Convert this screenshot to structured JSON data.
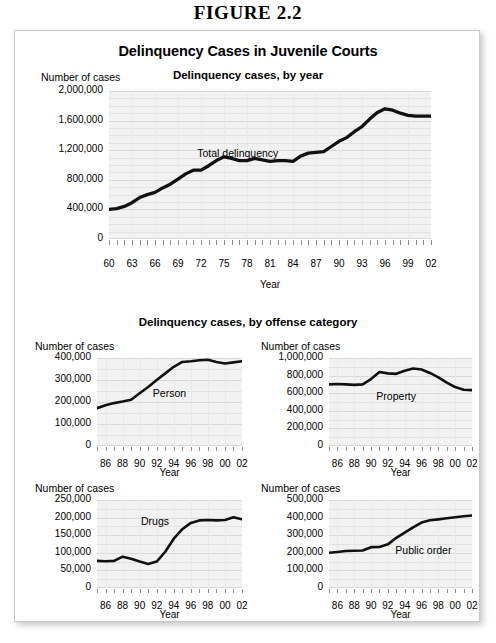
{
  "figure": {
    "caption": "FIGURE 2.2",
    "card_title": "Delinquency Cases in Juvenile Courts"
  },
  "sections": {
    "top_title": "Delinquency cases, by year",
    "bottom_title": "Delinquency cases, by offense category"
  },
  "common": {
    "y_axis_title": "Number of cases",
    "x_axis_title": "Year"
  },
  "chart_data": [
    {
      "id": "total-delinquency",
      "type": "line",
      "title": "Delinquency cases, by year",
      "series_label": "Total delinquency",
      "xlabel": "Year",
      "ylabel": "Number of cases",
      "grid": true,
      "legend_position": "inline",
      "xlim": [
        1960,
        2002
      ],
      "ylim": [
        0,
        2000000
      ],
      "ytick_labels": [
        "2,000,000",
        "1,600,000",
        "1,200,000",
        "800,000",
        "400,000",
        "0"
      ],
      "ytick_values": [
        2000000,
        1600000,
        1200000,
        800000,
        400000,
        0
      ],
      "xtick_labels": [
        "60",
        "63",
        "66",
        "69",
        "72",
        "75",
        "78",
        "81",
        "84",
        "87",
        "90",
        "93",
        "96",
        "99",
        "02"
      ],
      "xtick_values": [
        1960,
        1963,
        1966,
        1969,
        1972,
        1975,
        1978,
        1981,
        1984,
        1987,
        1990,
        1993,
        1996,
        1999,
        2002
      ],
      "x": [
        1960,
        1961,
        1962,
        1963,
        1964,
        1965,
        1966,
        1967,
        1968,
        1969,
        1970,
        1971,
        1972,
        1973,
        1974,
        1975,
        1976,
        1977,
        1978,
        1979,
        1980,
        1981,
        1982,
        1983,
        1984,
        1985,
        1986,
        1987,
        1988,
        1989,
        1990,
        1991,
        1992,
        1993,
        1994,
        1995,
        1996,
        1997,
        1998,
        1999,
        2000,
        2001,
        2002
      ],
      "values": [
        400000,
        410000,
        440000,
        490000,
        560000,
        600000,
        630000,
        690000,
        740000,
        810000,
        880000,
        930000,
        930000,
        990000,
        1060000,
        1110000,
        1090000,
        1060000,
        1060000,
        1090000,
        1070000,
        1050000,
        1060000,
        1060000,
        1050000,
        1120000,
        1160000,
        1170000,
        1180000,
        1250000,
        1320000,
        1370000,
        1450000,
        1520000,
        1620000,
        1710000,
        1760000,
        1740000,
        1700000,
        1670000,
        1660000,
        1660000,
        1660000
      ]
    },
    {
      "id": "person",
      "type": "line",
      "series_label": "Person",
      "xlabel": "Year",
      "ylabel": "Number of cases",
      "grid": true,
      "xlim": [
        1985,
        2002
      ],
      "ylim": [
        0,
        400000
      ],
      "ytick_labels": [
        "400,000",
        "300,000",
        "200,000",
        "100,000",
        "0"
      ],
      "ytick_values": [
        400000,
        300000,
        200000,
        100000,
        0
      ],
      "xtick_labels": [
        "86",
        "88",
        "90",
        "92",
        "94",
        "96",
        "98",
        "00",
        "02"
      ],
      "xtick_values": [
        1986,
        1988,
        1990,
        1992,
        1994,
        1996,
        1998,
        2000,
        2002
      ],
      "x": [
        1985,
        1986,
        1987,
        1988,
        1989,
        1990,
        1991,
        1992,
        1993,
        1994,
        1995,
        1996,
        1997,
        1998,
        1999,
        2000,
        2001,
        2002
      ],
      "values": [
        172000,
        185000,
        195000,
        202000,
        210000,
        240000,
        268000,
        300000,
        330000,
        360000,
        382000,
        385000,
        390000,
        392000,
        382000,
        375000,
        380000,
        385000
      ]
    },
    {
      "id": "property",
      "type": "line",
      "series_label": "Property",
      "xlabel": "Year",
      "ylabel": "Number of cases",
      "grid": true,
      "xlim": [
        1985,
        2002
      ],
      "ylim": [
        0,
        1000000
      ],
      "ytick_labels": [
        "1,000,000",
        "800,000",
        "600,000",
        "400,000",
        "200,000",
        "0"
      ],
      "ytick_values": [
        1000000,
        800000,
        600000,
        400000,
        200000,
        0
      ],
      "xtick_labels": [
        "86",
        "88",
        "90",
        "92",
        "94",
        "96",
        "98",
        "00",
        "02"
      ],
      "xtick_values": [
        1986,
        1988,
        1990,
        1992,
        1994,
        1996,
        1998,
        2000,
        2002
      ],
      "x": [
        1985,
        1986,
        1987,
        1988,
        1989,
        1990,
        1991,
        1992,
        1993,
        1994,
        1995,
        1996,
        1997,
        1998,
        1999,
        2000,
        2001,
        2002
      ],
      "values": [
        700000,
        705000,
        700000,
        695000,
        700000,
        760000,
        840000,
        825000,
        820000,
        855000,
        880000,
        870000,
        830000,
        780000,
        720000,
        670000,
        640000,
        635000
      ]
    },
    {
      "id": "drugs",
      "type": "line",
      "series_label": "Drugs",
      "xlabel": "Year",
      "ylabel": "Number of cases",
      "grid": true,
      "xlim": [
        1985,
        2002
      ],
      "ylim": [
        0,
        250000
      ],
      "ytick_labels": [
        "250,000",
        "200,000",
        "150,000",
        "100,000",
        "50,000",
        "0"
      ],
      "ytick_values": [
        250000,
        200000,
        150000,
        100000,
        50000,
        0
      ],
      "xtick_labels": [
        "86",
        "88",
        "90",
        "92",
        "94",
        "96",
        "98",
        "00",
        "02"
      ],
      "xtick_values": [
        1986,
        1988,
        1990,
        1992,
        1994,
        1996,
        1998,
        2000,
        2002
      ],
      "x": [
        1985,
        1986,
        1987,
        1988,
        1989,
        1990,
        1991,
        1992,
        1993,
        1994,
        1995,
        1996,
        1997,
        1998,
        1999,
        2000,
        2001,
        2002
      ],
      "values": [
        77000,
        76000,
        77000,
        89000,
        83000,
        75000,
        68000,
        75000,
        103000,
        140000,
        167000,
        185000,
        192000,
        193000,
        192000,
        193000,
        201000,
        195000
      ]
    },
    {
      "id": "public-order",
      "type": "line",
      "series_label": "Public order",
      "xlabel": "Year",
      "ylabel": "Number of cases",
      "grid": true,
      "xlim": [
        1985,
        2002
      ],
      "ylim": [
        0,
        500000
      ],
      "ytick_labels": [
        "500,000",
        "400,000",
        "300,000",
        "200,000",
        "100,000",
        "0"
      ],
      "ytick_values": [
        500000,
        400000,
        300000,
        200000,
        100000,
        0
      ],
      "xtick_labels": [
        "86",
        "88",
        "90",
        "92",
        "94",
        "96",
        "98",
        "00",
        "02"
      ],
      "xtick_values": [
        1986,
        1988,
        1990,
        1992,
        1994,
        1996,
        1998,
        2000,
        2002
      ],
      "x": [
        1985,
        1986,
        1987,
        1988,
        1989,
        1990,
        1991,
        1992,
        1993,
        1994,
        1995,
        1996,
        1997,
        1998,
        1999,
        2000,
        2001,
        2002
      ],
      "values": [
        200000,
        205000,
        210000,
        212000,
        213000,
        232000,
        233000,
        248000,
        285000,
        315000,
        345000,
        372000,
        385000,
        390000,
        396000,
        402000,
        408000,
        412000
      ]
    }
  ],
  "colors": {
    "line": "#111111",
    "plot_background": "#f2f2f2",
    "gridline": "#e2e2e2",
    "text": "#000000"
  }
}
